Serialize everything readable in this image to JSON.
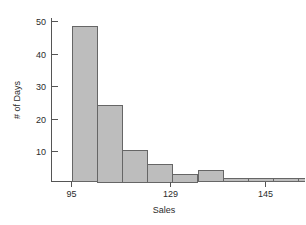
{
  "chart_data": {
    "type": "bar",
    "title": "",
    "subtitle": "",
    "xlabel": "Sales",
    "ylabel": "# of Days",
    "grid": false,
    "legend": "none",
    "orientation": "vertical",
    "histogram": true,
    "bin_width": 6.5,
    "xlim": [
      92,
      165
    ],
    "ylim": [
      0,
      52
    ],
    "x_ticks": [
      95,
      129,
      145
    ],
    "x_tick_labels": [
      "95",
      "129",
      "145"
    ],
    "y_ticks": [
      10,
      20,
      30,
      40,
      50
    ],
    "y_tick_labels": [
      "10",
      "20",
      "30",
      "40",
      "50"
    ],
    "bin_edges": [
      95,
      101.5,
      108,
      114.5,
      121,
      127.5,
      134,
      140.5,
      147,
      153.5,
      160,
      166.5
    ],
    "categories": [
      "95-101.5",
      "101.5-108",
      "108-114.5",
      "114.5-121",
      "121-127.5",
      "127.5-134",
      "134-140.5",
      "140.5-147",
      "147-153.5",
      "153.5-160",
      "160-166.5"
    ],
    "values": [
      48.5,
      24,
      10,
      5.5,
      2.5,
      3.5,
      1,
      1,
      1,
      1,
      1
    ],
    "bar_fill_color": "#bdbdbd",
    "bar_edge_color": "#666666",
    "axis_color": "#555555",
    "text_color": "#2b2b2b",
    "background_color": "#ffffff"
  },
  "figure": {
    "y_axis_title": "# of Days",
    "x_axis_title": "Sales"
  }
}
